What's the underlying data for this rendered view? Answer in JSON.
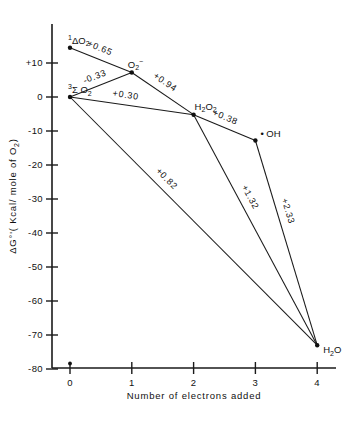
{
  "chart_data": {
    "type": "scatter",
    "title": "",
    "xlabel": "Number of electrons added",
    "ylabel": "ΔG°'(Kcal/mole of O₂)",
    "xlim": [
      0,
      4
    ],
    "ylim": [
      -85,
      17
    ],
    "grid": false,
    "legend": "none",
    "x_ticks": [
      "0",
      "1",
      "2",
      "3",
      "4"
    ],
    "x_tick_values": [
      0,
      1,
      2,
      3,
      4
    ],
    "y_ticks": [
      "+10",
      "0",
      "-10",
      "-20",
      "-30",
      "-40",
      "-50",
      "-60",
      "-70",
      "-80"
    ],
    "y_tick_values": [
      10,
      0,
      -10,
      -20,
      -30,
      -40,
      -50,
      -60,
      -70,
      -80
    ],
    "nodes": [
      {
        "id": "singlet_o2",
        "label_html": "<tspan class='sup' dy='-4'>1</tspan><tspan dy='4'>ΔO</tspan><tspan class='sub' dy='2.5'>2</tspan>",
        "label_text": "1ΔO2",
        "x": 0,
        "y": 14.5,
        "label_dx": -2,
        "label_dy": -4,
        "anchor": "start"
      },
      {
        "id": "triplet_o2",
        "label_html": "<tspan class='sup' dy='-4'>3</tspan><tspan dy='4'>Σ O</tspan><tspan class='sub' dy='2.5'>2</tspan>",
        "label_text": "3ΣO2",
        "x": 0,
        "y": 0,
        "label_dx": -2,
        "label_dy": -4,
        "anchor": "start"
      },
      {
        "id": "superoxide",
        "label_html": "<tspan>O</tspan><tspan class='sub' dy='2.5'>2</tspan><tspan class='sup' dy='-6'>−</tspan>",
        "label_text": "O2−",
        "x": 1,
        "y": 7.2,
        "label_dx": -4,
        "label_dy": -5,
        "anchor": "start"
      },
      {
        "id": "hydrogen_peroxide",
        "label_html": "<tspan>H</tspan><tspan class='sub' dy='2.5'>2</tspan><tspan dy='-2.5'>O</tspan><tspan class='sub' dy='2.5'>2</tspan>",
        "label_text": "H2O2",
        "x": 2,
        "y": -5.2,
        "label_dx": 1,
        "label_dy": -5,
        "anchor": "start"
      },
      {
        "id": "hydroxyl_radical",
        "label_html": "<tspan>• OH</tspan>",
        "label_text": "•OH",
        "x": 3,
        "y": -12.8,
        "label_dx": 5,
        "label_dy": -4,
        "anchor": "start"
      },
      {
        "id": "water",
        "label_html": "<tspan>H</tspan><tspan class='sub' dy='2.5'>2</tspan><tspan dy='-2.5'>O</tspan>",
        "label_text": "H2O",
        "x": 4,
        "y": -73,
        "label_dx": 6,
        "label_dy": 8,
        "anchor": "start"
      }
    ],
    "edges": [
      {
        "id": "singlet-to-superoxide",
        "from": "singlet_o2",
        "to": "superoxide",
        "value": "+0.65",
        "label_t": 0.42,
        "label_offset": -8,
        "rotate": true
      },
      {
        "id": "triplet-to-superoxide",
        "from": "triplet_o2",
        "to": "superoxide",
        "value": "-0.33",
        "label_t": 0.46,
        "label_offset": -7,
        "rotate": true
      },
      {
        "id": "superoxide-to-peroxide",
        "from": "superoxide",
        "to": "hydrogen_peroxide",
        "value": "+0.94",
        "label_t": 0.44,
        "label_offset": -8,
        "rotate": true
      },
      {
        "id": "triplet-to-peroxide",
        "from": "triplet_o2",
        "to": "hydrogen_peroxide",
        "value": "+0.30",
        "label_t": 0.44,
        "label_offset": -7,
        "rotate": true
      },
      {
        "id": "peroxide-to-hydroxyl",
        "from": "hydrogen_peroxide",
        "to": "hydroxyl_radical",
        "value": "+0.38",
        "label_t": 0.45,
        "label_offset": -7,
        "rotate": true
      },
      {
        "id": "triplet-to-water",
        "from": "triplet_o2",
        "to": "water",
        "value": "+0.82",
        "label_t": 0.36,
        "label_offset": -8,
        "rotate": true
      },
      {
        "id": "peroxide-to-water",
        "from": "hydrogen_peroxide",
        "to": "water",
        "value": "+1.32",
        "label_t": 0.38,
        "label_offset": -8,
        "rotate": true
      },
      {
        "id": "hydroxyl-to-water",
        "from": "hydroxyl_radical",
        "to": "water",
        "value": "+2.33",
        "label_t": 0.36,
        "label_offset": -8,
        "rotate": true
      }
    ],
    "origin_marker": {
      "x": 0,
      "y_axis_px": 368,
      "note": "dot on x-axis at 0"
    }
  }
}
